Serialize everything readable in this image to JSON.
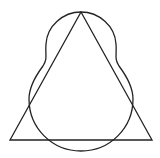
{
  "diagram": {
    "title": "Triangle inscribed with pear-shaped closed curve",
    "stroke_color": "#222222",
    "background": "#ffffff",
    "shapes": [
      {
        "type": "triangle",
        "name": "triangle",
        "points": [
          [
            81,
            12
          ],
          [
            10,
            140
          ],
          [
            152,
            140
          ]
        ]
      },
      {
        "type": "closed-curve",
        "name": "pear-curve",
        "top": [
          81,
          12
        ],
        "bottom": [
          81,
          151
        ],
        "lower_circle_center": [
          81,
          99
        ],
        "lower_circle_radius": 52
      }
    ]
  }
}
